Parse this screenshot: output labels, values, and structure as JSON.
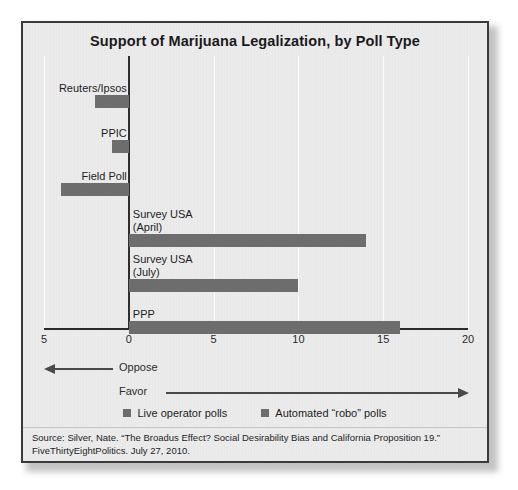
{
  "figure": {
    "title": "Support of Marijuana Legalization, by Poll Type",
    "source_line_1": "Source: Silver, Nate. “The Broadus Effect? Social Desirability Bias and California Proposition 19.”",
    "source_line_2": "FiveThirtyEightPolitics. July 27, 2010."
  },
  "direction": {
    "oppose_label": "Oppose",
    "favor_label": "Favor"
  },
  "legend": {
    "items": [
      {
        "label": "Live operator polls",
        "color": "#6d6d6d"
      },
      {
        "label": "Automated “robo” polls",
        "color": "#6d6d6d"
      }
    ]
  },
  "axis": {
    "tick_labels": [
      "5",
      "0",
      "5",
      "10",
      "15",
      "20"
    ]
  },
  "chart_data": {
    "type": "bar",
    "orientation": "horizontal",
    "title": "Support of Marijuana Legalization, by Poll Type",
    "xlabel": "",
    "ylabel": "",
    "xlim": [
      -5,
      20
    ],
    "xticks": [
      -5,
      0,
      5,
      10,
      15,
      20
    ],
    "xtick_labels": [
      "5",
      "0",
      "5",
      "10",
      "15",
      "20"
    ],
    "grid": true,
    "grid_axis": "x",
    "legend_position": "bottom",
    "note": "Negative values indicate net opposition; positive values indicate net support (margin in percentage points).",
    "categories": [
      "Reuters/Ipsos",
      "PPIC",
      "Field Poll",
      "Survey USA (April)",
      "Survey USA (July)",
      "PPP"
    ],
    "values": [
      -2,
      -1,
      -4,
      14,
      10,
      16
    ],
    "series": [
      {
        "name": "Net support margin",
        "values": [
          -2,
          -1,
          -4,
          14,
          10,
          16
        ]
      }
    ],
    "bars": [
      {
        "label": "Reuters/Ipsos",
        "label_line_1": "Reuters/Ipsos",
        "label_line_2": "",
        "value": -2,
        "poll_type": "Live operator polls"
      },
      {
        "label": "PPIC",
        "label_line_1": "PPIC",
        "label_line_2": "",
        "value": -1,
        "poll_type": "Live operator polls"
      },
      {
        "label": "Field Poll",
        "label_line_1": "Field Poll",
        "label_line_2": "",
        "value": -4,
        "poll_type": "Live operator polls"
      },
      {
        "label": "Survey USA (April)",
        "label_line_1": "Survey USA",
        "label_line_2": "(April)",
        "value": 14,
        "poll_type": "Automated “robo” polls"
      },
      {
        "label": "Survey USA (July)",
        "label_line_1": "Survey USA",
        "label_line_2": "(July)",
        "value": 10,
        "poll_type": "Automated “robo” polls"
      },
      {
        "label": "PPP",
        "label_line_1": "PPP",
        "label_line_2": "",
        "value": 16,
        "poll_type": "Automated “robo” polls"
      }
    ]
  }
}
